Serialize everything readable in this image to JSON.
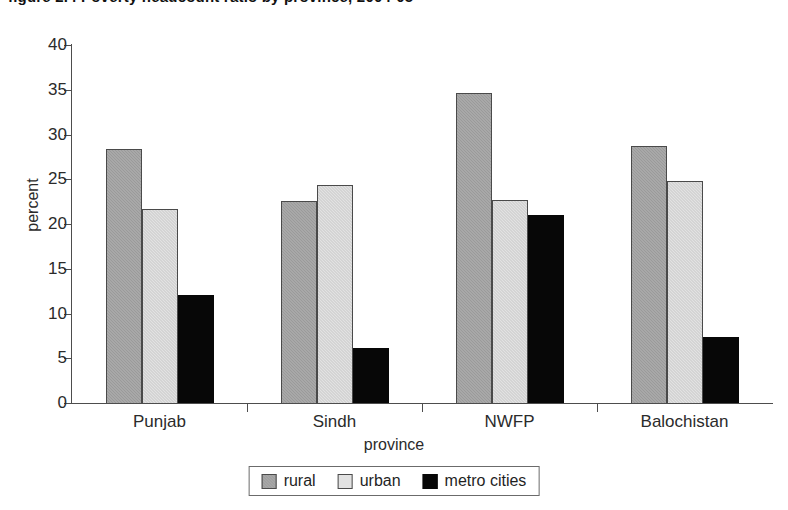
{
  "chart_data": {
    "type": "bar",
    "title": "figure 2.4  Poverty headcount ratio by province, 2004-05",
    "xlabel": "province",
    "ylabel": "percent",
    "ylim": [
      0,
      40
    ],
    "yticks": [
      0,
      5,
      10,
      15,
      20,
      25,
      30,
      35,
      40
    ],
    "ytick_labels": [
      "0",
      "5",
      "10",
      "15",
      "20",
      "25",
      "30",
      "35",
      "40"
    ],
    "grid": false,
    "legend_position": "bottom",
    "categories": [
      "Punjab",
      "Sindh",
      "NWFP",
      "Balochistan"
    ],
    "series": [
      {
        "name": "rural",
        "color": "#9a9a9a",
        "values": [
          28.4,
          22.6,
          34.6,
          28.7
        ]
      },
      {
        "name": "urban",
        "color": "#e2e2e2",
        "values": [
          21.7,
          24.4,
          22.7,
          24.8
        ]
      },
      {
        "name": "metro cities",
        "color": "#070707",
        "values": [
          12.1,
          6.1,
          21.0,
          7.4
        ]
      }
    ]
  },
  "legend": {
    "items": [
      {
        "label": "rural",
        "swatch": "rural-swatch"
      },
      {
        "label": "urban",
        "swatch": "urban-swatch"
      },
      {
        "label": "metro cities",
        "swatch": "metro-cities-swatch"
      }
    ]
  }
}
